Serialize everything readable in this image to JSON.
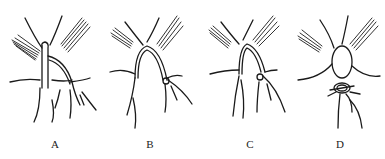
{
  "figure": {
    "panels": [
      {
        "id": "A",
        "label": "A",
        "description": "finger holding suture loop around structure"
      },
      {
        "id": "B",
        "label": "B",
        "description": "suture passed around vessel, loop formed"
      },
      {
        "id": "C",
        "label": "C",
        "description": "loop tightened around vessel"
      },
      {
        "id": "D",
        "label": "D",
        "description": "knot tied around vessel"
      }
    ]
  }
}
